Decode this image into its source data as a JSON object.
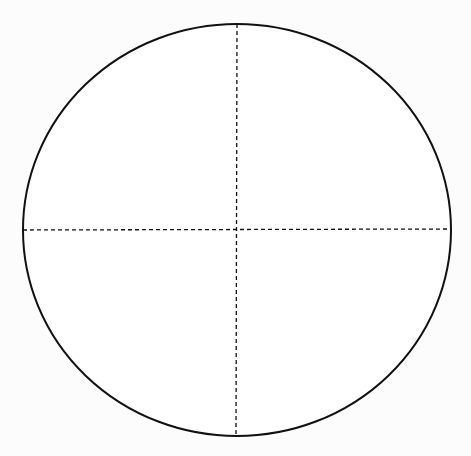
{
  "diagram": {
    "type": "ellipse-with-axes",
    "background": "#fcfcfc",
    "ellipse": {
      "cx": 237,
      "cy": 230,
      "rx": 214,
      "ry": 206,
      "stroke": "#111111",
      "stroke_width": 2,
      "fill": "#ffffff"
    },
    "axes": {
      "stroke": "#111111",
      "stroke_width": 1.3,
      "dasharray": "4,3",
      "horizontal": {
        "x1": 23,
        "y1": 230,
        "x2": 451,
        "y2": 229
      },
      "vertical": {
        "x1": 237,
        "y1": 24,
        "x2": 236,
        "y2": 436
      }
    }
  }
}
